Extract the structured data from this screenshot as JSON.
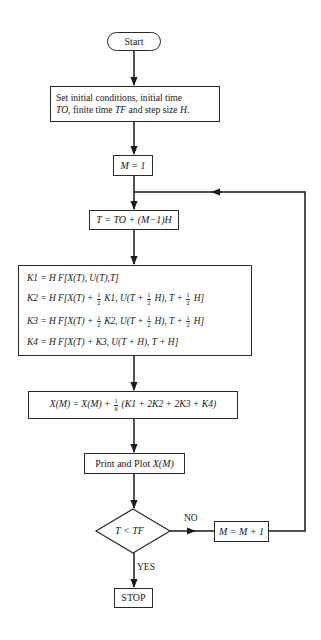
{
  "flowchart": {
    "title": "Runge-Kutta fourth-order integration flowchart",
    "nodes": {
      "start": {
        "type": "terminal",
        "label": "Start"
      },
      "setup": {
        "type": "process",
        "line1": "Set initial conditions, initial time",
        "line2_prefix": "TO",
        "line2_middle": ", finite time ",
        "line2_tf": "TF",
        "line2_suffix": " and step size ",
        "line2_h": "H",
        "line2_end": "."
      },
      "init_m": {
        "type": "process",
        "label": "M = 1"
      },
      "time": {
        "type": "process",
        "label": "T = TO + (M−1)H"
      },
      "k_coeffs": {
        "type": "process",
        "lines": [
          {
            "a": "K1 = H F[X(T), U(T),T]"
          },
          {
            "a": "K2 = H F[X(T) + ",
            "f1": [
              "1",
              "2"
            ],
            "b": " K1, U(T + ",
            "f2": [
              "1",
              "2"
            ],
            "c": " H), T + ",
            "f3": [
              "1",
              "2"
            ],
            "d": " H]"
          },
          {
            "a": "K3 = H F[X(T) + ",
            "f1": [
              "1",
              "2"
            ],
            "b": " K2, U(T + ",
            "f2": [
              "1",
              "2"
            ],
            "c": " H), T + ",
            "f3": [
              "1",
              "2"
            ],
            "d": " H]"
          },
          {
            "a": "K4 = H F[X(T) + K3, U(T + H), T + H]"
          }
        ]
      },
      "update_x": {
        "type": "process",
        "lhs": "X(M) = X(M) + ",
        "frac": [
          "1",
          "6"
        ],
        "rhs": " (K1 + 2K2 + 2K3 + K4)"
      },
      "print": {
        "type": "process",
        "text": "Print and Plot ",
        "var": "X(M)"
      },
      "decision": {
        "type": "decision",
        "label": "T < TF"
      },
      "increment": {
        "type": "process",
        "label": "M = M + 1"
      },
      "stop": {
        "type": "terminal",
        "label": "STOP"
      }
    },
    "edge_labels": {
      "no": "NO",
      "yes": "YES"
    },
    "edges": [
      {
        "from": "start",
        "to": "setup"
      },
      {
        "from": "setup",
        "to": "init_m"
      },
      {
        "from": "init_m",
        "to": "time"
      },
      {
        "from": "time",
        "to": "k_coeffs"
      },
      {
        "from": "k_coeffs",
        "to": "update_x"
      },
      {
        "from": "update_x",
        "to": "print"
      },
      {
        "from": "print",
        "to": "decision"
      },
      {
        "from": "decision",
        "to": "increment",
        "label": "NO"
      },
      {
        "from": "decision",
        "to": "stop",
        "label": "YES"
      },
      {
        "from": "increment",
        "to": "time",
        "note": "loop back"
      }
    ],
    "colors": {
      "line": "#1a1a1a",
      "background": "#ffffff"
    }
  }
}
